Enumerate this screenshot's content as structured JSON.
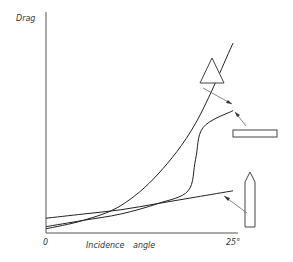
{
  "chart_data": {
    "type": "line",
    "title": "",
    "xlabel": "Incidence angle",
    "ylabel": "Drag",
    "x_ticks": [
      "0",
      "25°"
    ],
    "xlim": [
      0,
      25
    ],
    "ylim": [
      0,
      1
    ],
    "grid": false,
    "legend": "shape icons at right with pointer arrows",
    "series": [
      {
        "name": "triangle",
        "icon": "triangle-shape",
        "x": [
          0,
          5,
          10,
          15,
          20,
          25
        ],
        "y": [
          0.02,
          0.06,
          0.13,
          0.28,
          0.52,
          0.9
        ]
      },
      {
        "name": "flat-plate",
        "icon": "rectangle-shape",
        "x": [
          0,
          5,
          10,
          15,
          19,
          20,
          21,
          25
        ],
        "y": [
          0.03,
          0.06,
          0.09,
          0.14,
          0.2,
          0.35,
          0.5,
          0.58
        ]
      },
      {
        "name": "pointed-body",
        "icon": "bullet-shape",
        "x": [
          0,
          5,
          10,
          15,
          20,
          25
        ],
        "y": [
          0.07,
          0.09,
          0.11,
          0.14,
          0.17,
          0.2
        ]
      }
    ]
  }
}
